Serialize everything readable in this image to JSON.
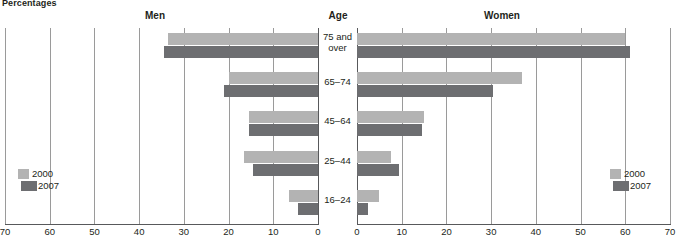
{
  "unit_label": "Percentages",
  "headings": {
    "men": "Men",
    "age": "Age",
    "women": "Women"
  },
  "legend": {
    "items": [
      {
        "label": "2000",
        "color": "#b3b3b3"
      },
      {
        "label": "2007",
        "color": "#6d6e71"
      }
    ]
  },
  "axis": {
    "left_ticks": [
      "70",
      "60",
      "50",
      "40",
      "30",
      "20",
      "10",
      "0"
    ],
    "right_ticks": [
      "0",
      "10",
      "20",
      "30",
      "40",
      "50",
      "60",
      "70"
    ]
  },
  "chart_data": {
    "type": "bar",
    "title": "",
    "subtitle": "",
    "xlabel": "Percentages",
    "ylabel": "Age",
    "orientation": "horizontal",
    "layout": "population-pyramid",
    "grid": true,
    "legend_position": "bottom-left and bottom-right",
    "xlim": [
      0,
      70
    ],
    "categories": [
      "75 and over",
      "65–74",
      "45–64",
      "25–44",
      "16–24"
    ],
    "panels": [
      {
        "name": "Men",
        "direction": "left",
        "series": [
          {
            "name": "2000",
            "color": "#b3b3b3",
            "values": [
              33.5,
              20.0,
              15.5,
              16.5,
              6.5
            ]
          },
          {
            "name": "2007",
            "color": "#6d6e71",
            "values": [
              34.5,
              21.0,
              15.5,
              14.5,
              4.5
            ]
          }
        ]
      },
      {
        "name": "Women",
        "direction": "right",
        "series": [
          {
            "name": "2000",
            "color": "#b3b3b3",
            "values": [
              60.0,
              37.0,
              15.0,
              7.5,
              5.0
            ]
          },
          {
            "name": "2007",
            "color": "#6d6e71",
            "values": [
              61.0,
              30.5,
              14.5,
              9.5,
              2.5
            ]
          }
        ]
      }
    ]
  }
}
